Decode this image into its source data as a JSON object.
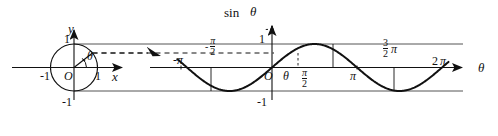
{
  "figure": {
    "ink_color": "#111111",
    "guide_color": "#666666"
  },
  "circle_panel": {
    "axis_x_label": "x",
    "axis_y_label": "y",
    "origin_label": "O",
    "angle_label": "θ",
    "x_tick_neg1": "-1",
    "x_tick_pos1": "1",
    "y_tick_pos1": "1",
    "y_tick_neg1": "-1",
    "radius_value": 1,
    "angle_degrees": 38
  },
  "sine_panel": {
    "axis_y_label_fn": "sin",
    "axis_y_label_var": "θ",
    "axis_x_label": "θ",
    "origin_label": "O",
    "theta_label": "θ",
    "y_tick_pos1": "1",
    "y_tick_neg1": "-1",
    "tick_neg_pi": "-π",
    "tick_neg_half_pi_num": "π",
    "tick_neg_half_pi_den": "2",
    "tick_neg_half_pi_sign": "-",
    "tick_half_pi_num": "π",
    "tick_half_pi_den": "2",
    "tick_pi": "π",
    "tick_three_half_pi_num": "3",
    "tick_three_half_pi_den": "2",
    "tick_three_half_pi_sym": "π",
    "tick_two_pi_num": "2",
    "tick_two_pi_sym": "π"
  },
  "chart_data": {
    "type": "line",
    "title": "",
    "xlabel": "θ",
    "ylabel": "sin θ",
    "xlim": [
      -3.665,
      6.807
    ],
    "ylim": [
      -1.35,
      1.35
    ],
    "grid": false,
    "legend": null,
    "x_tick_values": [
      -3.1416,
      -1.5708,
      0,
      1.5708,
      3.1416,
      4.7124,
      6.2832
    ],
    "x_tick_labels": [
      "-π",
      "-π/2",
      "O",
      "π/2",
      "π",
      "3π/2",
      "2π"
    ],
    "y_tick_values": [
      -1,
      1
    ],
    "y_tick_labels": [
      "-1",
      "1"
    ],
    "series": [
      {
        "name": "sin θ",
        "x": [
          -3.1416,
          -2.7489,
          -2.3562,
          -1.9635,
          -1.5708,
          -1.1781,
          -0.7854,
          -0.3927,
          0,
          0.3927,
          0.7854,
          1.1781,
          1.5708,
          1.9635,
          2.3562,
          2.7489,
          3.1416,
          3.5343,
          3.927,
          4.3197,
          4.7124,
          5.1051,
          5.4978,
          5.8905,
          6.2832
        ],
        "y": [
          0,
          -0.3827,
          -0.7071,
          -0.9239,
          -1,
          -0.9239,
          -0.7071,
          -0.3827,
          0,
          0.3827,
          0.7071,
          0.9239,
          1,
          0.9239,
          0.7071,
          0.3827,
          0,
          -0.3827,
          -0.7071,
          -0.9239,
          -1,
          -0.9239,
          -0.7071,
          -0.3827,
          0
        ]
      }
    ],
    "annotations": [
      {
        "name": "unit-circle",
        "type": "circle",
        "cx": 0,
        "cy": 0,
        "r": 1
      },
      {
        "name": "sin-level-dashed-line",
        "type": "hline",
        "y": 0.62
      },
      {
        "name": "theta-marker",
        "type": "vline",
        "x": 0.66
      }
    ]
  }
}
